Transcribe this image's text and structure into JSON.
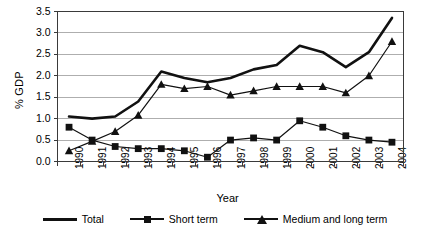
{
  "chart_data": {
    "type": "line",
    "title": "",
    "xlabel": "Year",
    "ylabel": "% GDP",
    "categories": [
      "1990",
      "1991",
      "1992",
      "1993",
      "1994",
      "1995",
      "1996",
      "1997",
      "1998",
      "1999",
      "2000",
      "2001",
      "2002",
      "2003",
      "2004"
    ],
    "ylim": [
      0.0,
      3.5
    ],
    "ytick_labels": [
      "0.0",
      "0.5",
      "1.0",
      "1.5",
      "2.0",
      "2.5",
      "3.0",
      "3.5"
    ],
    "ytick_values": [
      0.0,
      0.5,
      1.0,
      1.5,
      2.0,
      2.5,
      3.0,
      3.5
    ],
    "grid": true,
    "grid_axis": "y",
    "legend_position": "bottom",
    "series": [
      {
        "name": "Total",
        "marker": "none",
        "line_width": "thick",
        "color": "#111111",
        "values": [
          1.05,
          1.0,
          1.05,
          1.4,
          2.1,
          1.95,
          1.85,
          1.95,
          2.15,
          2.25,
          2.7,
          2.55,
          2.2,
          2.55,
          3.35
        ]
      },
      {
        "name": "Short term",
        "marker": "square",
        "line_width": "thin",
        "color": "#111111",
        "values": [
          0.8,
          0.5,
          0.35,
          0.3,
          0.3,
          0.25,
          0.1,
          0.5,
          0.55,
          0.5,
          0.95,
          0.8,
          0.6,
          0.5,
          0.45
        ]
      },
      {
        "name": "Medium and long term",
        "marker": "triangle",
        "line_width": "thin",
        "color": "#111111",
        "values": [
          0.25,
          0.47,
          0.7,
          1.08,
          1.8,
          1.7,
          1.75,
          1.55,
          1.65,
          1.75,
          1.75,
          1.75,
          1.6,
          2.0,
          2.8
        ]
      }
    ]
  },
  "colors": {
    "ink": "#111111",
    "grid": "#9a9a9a",
    "axis": "#3a3a3a",
    "background": "#ffffff"
  }
}
